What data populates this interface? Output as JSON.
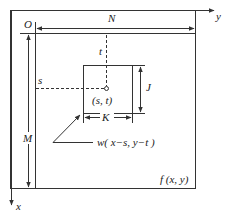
{
  "diagram": {
    "colors": {
      "line": "#333333",
      "background": "#ffffff"
    },
    "labels": {
      "origin": "O",
      "width": "N",
      "height": "M",
      "t": "t",
      "s": "s",
      "center": "(s, t)",
      "mask_height": "J",
      "mask_width": "K",
      "mask_function": "w( x−s, y−t )",
      "image_function": "f (x, y)",
      "x_axis": "x",
      "y_axis": "y"
    },
    "elements": [
      {
        "id": "outer-frame",
        "type": "rect"
      },
      {
        "id": "image-region",
        "type": "rect",
        "label": "f (x, y)"
      },
      {
        "id": "mask-window",
        "type": "rect",
        "label": "w( x−s, y−t )"
      },
      {
        "id": "center-point",
        "type": "point",
        "label": "(s, t)"
      }
    ]
  }
}
